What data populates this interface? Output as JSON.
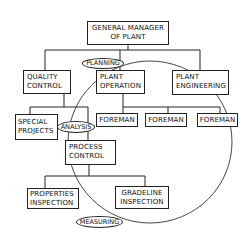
{
  "diagram": {
    "type": "organization-chart",
    "nodes": {
      "general_manager": {
        "line1": "GENERAL MANAGER",
        "line2": "OF PLANT"
      },
      "quality_control": {
        "line1": "QUALITY",
        "line2": "CONTROL"
      },
      "plant_operation": {
        "line1": "PLANT",
        "line2": "OPERATION"
      },
      "plant_engineering": {
        "line1": "PLANT",
        "line2": "ENGINEERING"
      },
      "foreman_1": {
        "label": "FOREMAN"
      },
      "foreman_2": {
        "label": "FOREMAN"
      },
      "foreman_3": {
        "label": "FOREMAN"
      },
      "special_projects": {
        "line1": "SPECIAL",
        "line2": "PROJECTS"
      },
      "process_control": {
        "line1": "PROCESS",
        "line2": "CONTROL"
      },
      "properties_inspection": {
        "line1": "PROPERTIES",
        "line2": "INSPECTION"
      },
      "gradeline_inspection": {
        "line1": "GRADELINE",
        "line2": "INSPECTION"
      }
    },
    "cycle_labels": {
      "planning": "PLANNING",
      "analysis": "ANALYSIS",
      "measuring": "MEASURING"
    },
    "colors": {
      "stroke": "#222222",
      "background": "#ffffff",
      "text": "#111111"
    }
  }
}
